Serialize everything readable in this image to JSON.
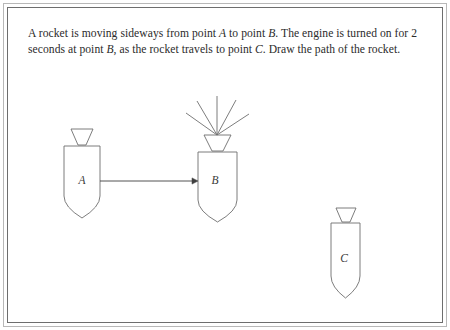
{
  "figure": {
    "frame": {
      "outer_border_color": "#b8b8b8",
      "inner_border_color": "#6e6e6e",
      "background_color": "#ffffff"
    },
    "prompt": {
      "line1_part1": "A rocket is moving sideways from point ",
      "line1_em1": "A",
      "line1_part2": " to point ",
      "line1_em2": "B",
      "line1_part3": ". The engine is turned on for 2 seconds at point ",
      "line1_em3": "B",
      "line1_part4": ", as the rocket travels to point ",
      "line1_em4": "C",
      "line1_part5": ". Draw the path of the rocket.",
      "full_text": "A rocket is moving sideways from point A to point B. The engine is turned on for 2 seconds at point B, as the rocket travels to point C. Draw the path of the rocket.",
      "duration_seconds": "2"
    },
    "stroke_color": "#6e6e6e",
    "arrow_color": "#3f3f3f",
    "rockets": [
      {
        "id": "rocket-a",
        "label": "A",
        "label_x": 82,
        "label_y": 184,
        "body_left": 64,
        "body_right": 100,
        "body_top": 146,
        "body_bottom": 196,
        "tip_y": 218,
        "nose_top_left": 71,
        "nose_top_right": 93,
        "nose_top_y": 129,
        "nose_bottom_left": 78,
        "nose_bottom_right": 86,
        "nose_bottom_y": 145,
        "has_exhaust": false,
        "exhaust_line_count": 0
      },
      {
        "id": "rocket-b",
        "label": "B",
        "label_x": 215,
        "label_y": 184,
        "body_left": 198,
        "body_right": 237,
        "body_top": 152,
        "body_bottom": 200,
        "tip_y": 222,
        "nose_top_left": 204,
        "nose_top_right": 231,
        "nose_top_y": 135,
        "nose_bottom_left": 212,
        "nose_bottom_right": 223,
        "nose_bottom_y": 151,
        "has_exhaust": true,
        "exhaust_line_count": 5,
        "exhaust_origin_x": 217,
        "exhaust_origin_y": 135,
        "exhaust_tips": [
          [
            186,
            113
          ],
          [
            197,
            101
          ],
          [
            217,
            96
          ],
          [
            236,
            100
          ],
          [
            249,
            114
          ]
        ]
      },
      {
        "id": "rocket-c",
        "label": "C",
        "label_x": 344,
        "label_y": 262,
        "body_left": 331,
        "body_right": 360,
        "body_top": 223,
        "body_bottom": 276,
        "tip_y": 298,
        "nose_top_left": 336,
        "nose_top_right": 356,
        "nose_top_y": 208,
        "nose_bottom_left": 342,
        "nose_bottom_right": 350,
        "nose_bottom_y": 222,
        "has_exhaust": false,
        "exhaust_line_count": 0
      }
    ],
    "arrow": {
      "name": "motion-arrow-a-to-b",
      "from_x": 100,
      "from_y": 181,
      "to_x": 198,
      "to_y": 181,
      "head_size": 6
    }
  }
}
